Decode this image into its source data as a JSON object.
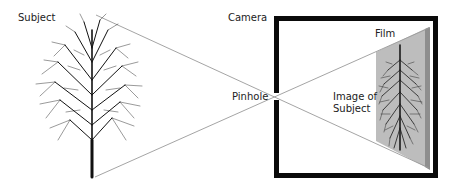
{
  "diagram": {
    "labels": {
      "subject": "Subject",
      "camera": "Camera",
      "film": "Film",
      "pinhole": "Pinhole",
      "image_line1": "Image of",
      "image_line2": "Subject"
    },
    "colors": {
      "background": "#ffffff",
      "camera_frame": "#0a0a0a",
      "ray": "#9a9a9a",
      "film_panel": "#b9b9b9",
      "film_edge": "#8c8c8c",
      "tree": "#111111",
      "text": "#222222"
    },
    "geometry": {
      "subject_top": [
        96,
        15
      ],
      "subject_bottom": [
        95,
        177
      ],
      "pinhole": [
        277,
        97
      ],
      "film_top": [
        429,
        28
      ],
      "film_bottom": [
        429,
        168
      ],
      "camera_box": {
        "x": 274,
        "y": 16,
        "w": 164,
        "h": 162,
        "border": 5
      }
    }
  }
}
